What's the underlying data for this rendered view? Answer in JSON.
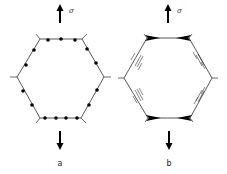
{
  "figure": {
    "panels": [
      {
        "id": "a",
        "label": "a",
        "stress_symbol": "σ",
        "description": "Hexagonal grain with particles (dots) along grain boundaries, under tensile stress"
      },
      {
        "id": "b",
        "label": "b",
        "stress_symbol": "σ",
        "description": "Hexagonal grain with wedge cracks at triple junctions and sliding boundaries (half-arrows)"
      }
    ],
    "colors": {
      "line": "#333333",
      "fill": "#000000",
      "background": "#ffffff"
    }
  }
}
